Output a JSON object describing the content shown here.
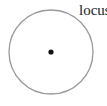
{
  "diagram": {
    "label": "locus",
    "circle": {
      "cx": 51,
      "cy": 52,
      "r": 42,
      "stroke": "#999999"
    },
    "center_point": {
      "cx": 51,
      "cy": 52,
      "r": 2.6,
      "fill": "#111111"
    }
  }
}
